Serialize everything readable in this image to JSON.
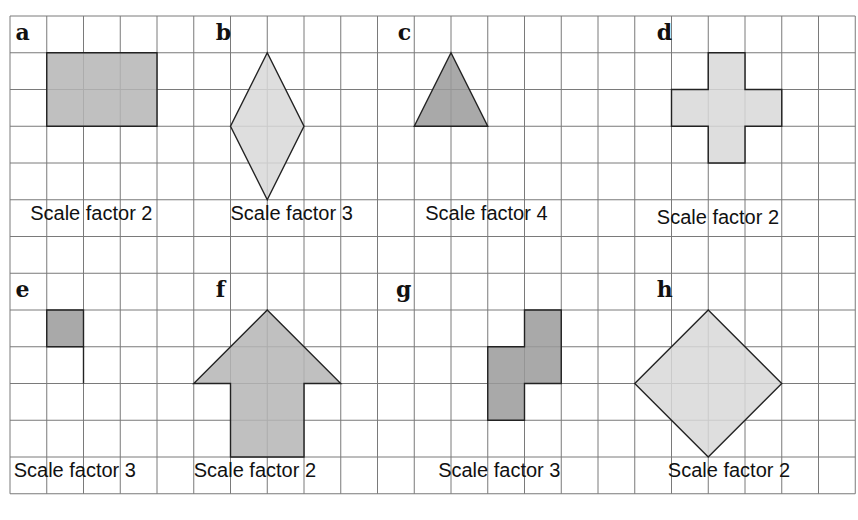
{
  "grid": {
    "origin_x": 10,
    "origin_y": 16,
    "cell": 36.75,
    "cols": 23,
    "rows": 13,
    "line_color": "#7a7a7a",
    "background": "#ffffff"
  },
  "colors": {
    "shape_dark": "#9a9a9a",
    "shape_mid": "#b5b5b5",
    "shape_light": "#d8d8d8",
    "outline": "#222222",
    "text": "#111111"
  },
  "problems": [
    {
      "id": "a",
      "label": "a",
      "caption": "Scale factor 2",
      "shape": "rectangle",
      "points": [
        [
          1,
          1
        ],
        [
          4,
          1
        ],
        [
          4,
          3
        ],
        [
          1,
          3
        ]
      ],
      "fill": "shape_mid",
      "label_pos": [
        0.15,
        0.65
      ],
      "caption_pos": [
        0.55,
        5.55
      ]
    },
    {
      "id": "b",
      "label": "b",
      "caption": "Scale factor 3",
      "shape": "rhombus",
      "points": [
        [
          7,
          1
        ],
        [
          8,
          3
        ],
        [
          7,
          5
        ],
        [
          6,
          3
        ]
      ],
      "fill": "shape_light",
      "label_pos": [
        5.6,
        0.65
      ],
      "caption_pos": [
        6.0,
        5.55
      ]
    },
    {
      "id": "c",
      "label": "c",
      "caption": "Scale factor 4",
      "shape": "triangle",
      "points": [
        [
          12,
          1
        ],
        [
          13,
          3
        ],
        [
          11,
          3
        ]
      ],
      "fill": "shape_dark",
      "label_pos": [
        10.55,
        0.65
      ],
      "caption_pos": [
        11.3,
        5.55
      ]
    },
    {
      "id": "d",
      "label": "d",
      "caption": "Scale factor 2",
      "shape": "cross",
      "points": [
        [
          19,
          1
        ],
        [
          20,
          1
        ],
        [
          20,
          2
        ],
        [
          21,
          2
        ],
        [
          21,
          3
        ],
        [
          20,
          3
        ],
        [
          20,
          4
        ],
        [
          19,
          4
        ],
        [
          19,
          3
        ],
        [
          18,
          3
        ],
        [
          18,
          2
        ],
        [
          19,
          2
        ]
      ],
      "fill": "shape_light",
      "label_pos": [
        17.6,
        0.65
      ],
      "caption_pos": [
        17.6,
        5.65
      ]
    },
    {
      "id": "e",
      "label": "e",
      "caption": "Scale factor 3",
      "shape": "unit-square",
      "points": [
        [
          1,
          8
        ],
        [
          2,
          8
        ],
        [
          2,
          9
        ],
        [
          1,
          9
        ]
      ],
      "fill": "shape_dark",
      "extra_line": [
        [
          2,
          9
        ],
        [
          2,
          10
        ]
      ],
      "label_pos": [
        0.15,
        7.65
      ],
      "caption_pos": [
        0.1,
        12.55
      ]
    },
    {
      "id": "f",
      "label": "f",
      "caption": "Scale factor 2",
      "shape": "arrow",
      "points": [
        [
          7,
          8
        ],
        [
          9,
          10
        ],
        [
          8,
          10
        ],
        [
          8,
          12
        ],
        [
          6,
          12
        ],
        [
          6,
          10
        ],
        [
          5,
          10
        ]
      ],
      "fill": "shape_mid",
      "label_pos": [
        5.6,
        7.65
      ],
      "caption_pos": [
        5.0,
        12.55
      ]
    },
    {
      "id": "g",
      "label": "g",
      "caption": "Scale factor 3",
      "shape": "s-tetromino",
      "points": [
        [
          14,
          8
        ],
        [
          15,
          8
        ],
        [
          15,
          10
        ],
        [
          14,
          10
        ],
        [
          14,
          11
        ],
        [
          13,
          11
        ],
        [
          13,
          9
        ],
        [
          14,
          9
        ]
      ],
      "fill": "shape_dark",
      "label_pos": [
        10.5,
        7.65
      ],
      "caption_pos": [
        11.65,
        12.55
      ]
    },
    {
      "id": "h",
      "label": "h",
      "caption": "Scale factor 2",
      "shape": "square-diamond",
      "points": [
        [
          19,
          8
        ],
        [
          21,
          10
        ],
        [
          19,
          12
        ],
        [
          17,
          10
        ]
      ],
      "fill": "shape_light",
      "label_pos": [
        17.6,
        7.65
      ],
      "caption_pos": [
        17.9,
        12.55
      ]
    }
  ]
}
